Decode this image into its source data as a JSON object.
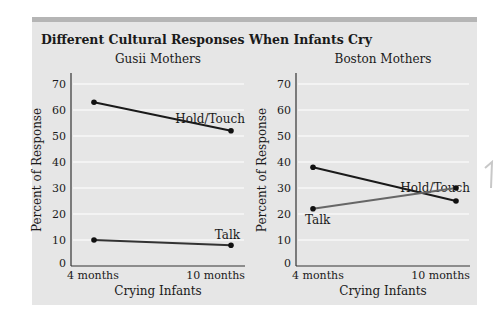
{
  "figure": {
    "title": "Different Cultural Responses When Infants Cry"
  },
  "chart_data": [
    {
      "type": "line",
      "title": "Gusii Mothers",
      "xlabel": "Crying Infants",
      "ylabel": "Percent of Response",
      "categories": [
        "4 months",
        "10 months"
      ],
      "ylim": [
        0,
        75
      ],
      "yticks": [
        0,
        10,
        20,
        30,
        40,
        50,
        60,
        70
      ],
      "grid": true,
      "series": [
        {
          "name": "Hold/Touch",
          "values": [
            63,
            52
          ],
          "color": "#1a1a1a"
        },
        {
          "name": "Talk",
          "values": [
            10,
            8
          ],
          "color": "#333333"
        }
      ]
    },
    {
      "type": "line",
      "title": "Boston Mothers",
      "xlabel": "Crying Infants",
      "ylabel": "Percent of Response",
      "categories": [
        "4 months",
        "10 months"
      ],
      "ylim": [
        0,
        75
      ],
      "yticks": [
        0,
        10,
        20,
        30,
        40,
        50,
        60,
        70
      ],
      "grid": true,
      "series": [
        {
          "name": "Hold/Touch",
          "values": [
            38,
            25
          ],
          "color": "#1a1a1a"
        },
        {
          "name": "Talk",
          "values": [
            22,
            30
          ],
          "color": "#666666"
        }
      ]
    }
  ],
  "colors": {
    "panel_bg": "#e6e6e6",
    "panel_band": "#b5b5b5",
    "gridline": "#f7f7f7",
    "axis": "#333333",
    "text": "#1a1a1a"
  }
}
